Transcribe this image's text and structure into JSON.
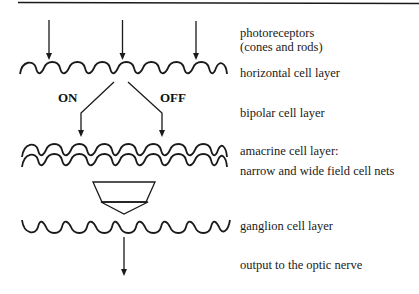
{
  "diagram": {
    "type": "retina-layer-flow",
    "layers": [
      {
        "id": "photoreceptors",
        "label_lines": [
          "photoreceptors",
          "(cones and rods)"
        ]
      },
      {
        "id": "horizontal",
        "label_lines": [
          "horizontal cell layer"
        ]
      },
      {
        "id": "bipolar",
        "label_lines": [
          "bipolar cell layer"
        ]
      },
      {
        "id": "amacrine",
        "label_lines": [
          "amacrine cell layer:",
          "narrow and wide field cell nets"
        ]
      },
      {
        "id": "ganglion",
        "label_lines": [
          "ganglion cell layer"
        ]
      },
      {
        "id": "output",
        "label_lines": [
          "output to the optic nerve"
        ]
      }
    ],
    "pathways": {
      "on_label": "ON",
      "off_label": "OFF"
    },
    "colors": {
      "ink": "#1a1a1a",
      "background": "#ffffff"
    }
  }
}
